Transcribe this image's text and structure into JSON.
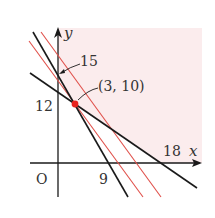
{
  "diagram": {
    "type": "linear-programming-graph",
    "colors": {
      "feasible_region": "#fbeced",
      "constraint_line": "#1a1a1a",
      "objective_line": "#e0504a",
      "optimal_point": "#e8231e",
      "axis": "#1a1a1a",
      "text": "#333333"
    },
    "axes": {
      "x_label": "x",
      "y_label": "y",
      "origin_label": "O"
    },
    "labels": {
      "y_intercept_15": "15",
      "y_intercept_12": "12",
      "x_intercept_9": "9",
      "x_intercept_18": "18",
      "optimal_point": "(3, 10)"
    },
    "constraint_lines": [
      {
        "name": "steep",
        "x_intercept": 9,
        "y_intercept": 15
      },
      {
        "name": "shallow",
        "x_intercept": 18,
        "y_intercept": 12
      }
    ],
    "objective_lines": [
      {
        "name": "through-optimum",
        "passes_through": [
          3,
          10
        ]
      },
      {
        "name": "shifted",
        "note": "parallel, further from origin"
      }
    ],
    "optimal_point": {
      "x": 3,
      "y": 10
    }
  }
}
